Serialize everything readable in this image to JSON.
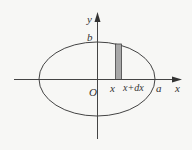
{
  "diagram": {
    "labels": {
      "y_axis": "y",
      "x_axis": "x",
      "b": "b",
      "a": "a",
      "origin": "O",
      "strip_left": "x",
      "strip_right": "x+dx"
    },
    "colors": {
      "stroke": "#444444",
      "strip_fill": "#a8a8a8",
      "background": "#f7f7f5"
    }
  }
}
